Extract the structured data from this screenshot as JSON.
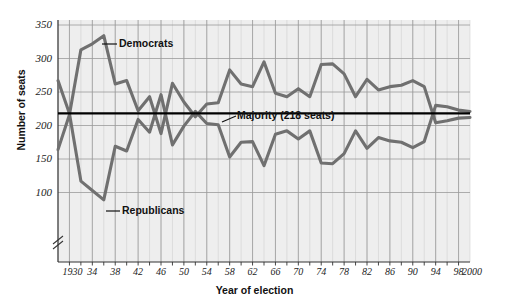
{
  "figure": {
    "background": "#ffffff",
    "plot_background": "#eeeeee",
    "grid_color": "#9a9a9a",
    "series_color": "#707070",
    "majority_line_color": "#000000"
  },
  "axis_titles": {
    "y": "Number of seats",
    "x": "Year of election"
  },
  "annotations": {
    "democrats": "Democrats",
    "republicans": "Republicans",
    "majority": "Majority (218 seats)"
  },
  "y_ticks": [
    "350",
    "300",
    "250",
    "200",
    "150",
    "100"
  ],
  "x_ticks": [
    "1930",
    "34",
    "38",
    "42",
    "46",
    "50",
    "54",
    "58",
    "62",
    "66",
    "70",
    "74",
    "78",
    "82",
    "86",
    "90",
    "94",
    "98",
    "2000"
  ],
  "chart_data": {
    "type": "line",
    "title": "",
    "xlabel": "Year of election",
    "ylabel": "Number of seats",
    "xlim": [
      1928,
      2000
    ],
    "ylim": [
      85,
      355
    ],
    "grid": true,
    "axis_break": "y-axis broken below 100",
    "legend_position": "inline-labels",
    "x": [
      1928,
      1930,
      1932,
      1934,
      1936,
      1938,
      1940,
      1942,
      1944,
      1946,
      1948,
      1950,
      1952,
      1954,
      1956,
      1958,
      1960,
      1962,
      1964,
      1966,
      1968,
      1970,
      1972,
      1974,
      1976,
      1978,
      1980,
      1982,
      1984,
      1986,
      1988,
      1990,
      1992,
      1994,
      1996,
      1998,
      2000
    ],
    "series": [
      {
        "name": "Democrats",
        "color": "#707070",
        "values": [
          164,
          216,
          313,
          322,
          334,
          262,
          267,
          222,
          243,
          188,
          263,
          235,
          213,
          232,
          234,
          283,
          262,
          258,
          295,
          248,
          243,
          255,
          243,
          291,
          292,
          277,
          243,
          269,
          253,
          258,
          260,
          267,
          258,
          204,
          207,
          211,
          212
        ]
      },
      {
        "name": "Republicans",
        "color": "#707070",
        "values": [
          267,
          218,
          117,
          103,
          89,
          169,
          162,
          209,
          190,
          246,
          171,
          199,
          221,
          203,
          201,
          153,
          175,
          176,
          140,
          187,
          192,
          180,
          192,
          144,
          143,
          158,
          192,
          166,
          182,
          177,
          175,
          167,
          176,
          230,
          228,
          223,
          221
        ]
      }
    ],
    "reference_line": {
      "label": "Majority (218 seats)",
      "value": 218
    }
  }
}
